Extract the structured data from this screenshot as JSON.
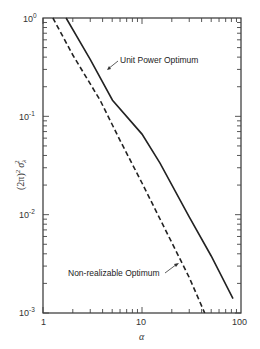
{
  "chart_data": {
    "type": "line",
    "title": "",
    "xlabel": "α",
    "ylabel": "(2π)² σ_λ²",
    "xscale": "log",
    "yscale": "log",
    "xlim": [
      1,
      100
    ],
    "ylim": [
      0.001,
      1
    ],
    "x_ticks": [
      {
        "value": 1,
        "label": "1"
      },
      {
        "value": 10,
        "label": "10"
      },
      {
        "value": 100,
        "label": "100"
      }
    ],
    "y_ticks": [
      {
        "value": 1,
        "label": "10",
        "exp": "0"
      },
      {
        "value": 0.1,
        "label": "10",
        "exp": "-1"
      },
      {
        "value": 0.01,
        "label": "10",
        "exp": "-2"
      },
      {
        "value": 0.001,
        "label": "10",
        "exp": "-3"
      }
    ],
    "grid": false,
    "legend": "none (inline annotations)",
    "series": [
      {
        "name": "Unit Power Optimum",
        "style": "solid",
        "x": [
          1.71,
          3.0,
          5.04,
          10.0,
          15.2,
          30.0,
          50.0,
          83.0
        ],
        "y": [
          1.0,
          0.38,
          0.146,
          0.066,
          0.0334,
          0.0095,
          0.0038,
          0.0014
        ]
      },
      {
        "name": "Non-realizable Optimum",
        "style": "dashed",
        "x": [
          1.26,
          2.0,
          3.77,
          6.0,
          10.0,
          20.0,
          30.0,
          43.0
        ],
        "y": [
          1.0,
          0.42,
          0.146,
          0.057,
          0.021,
          0.0052,
          0.0023,
          0.001
        ]
      }
    ],
    "annotations": [
      {
        "text": "Unit Power Optimum",
        "points_to": "Unit Power Optimum"
      },
      {
        "text": "Non-realizable Optimum",
        "points_to": "Non-realizable Optimum"
      }
    ]
  },
  "labels": {
    "x_axis": "α",
    "y_axis_main": "(2π)",
    "y_axis_sup1": "2",
    "y_axis_sigma": "σ",
    "y_axis_sub": "λ",
    "y_axis_sup2": "2",
    "anno_unit_power": "Unit Power Optimum",
    "anno_nonrealizable": "Non-realizable Optimum",
    "xtick_1": "1",
    "xtick_10": "10",
    "xtick_100": "100",
    "ytick_base": "10",
    "ytick_exp_0": "0",
    "ytick_exp_1": "-1",
    "ytick_exp_2": "-2",
    "ytick_exp_3": "-3"
  }
}
